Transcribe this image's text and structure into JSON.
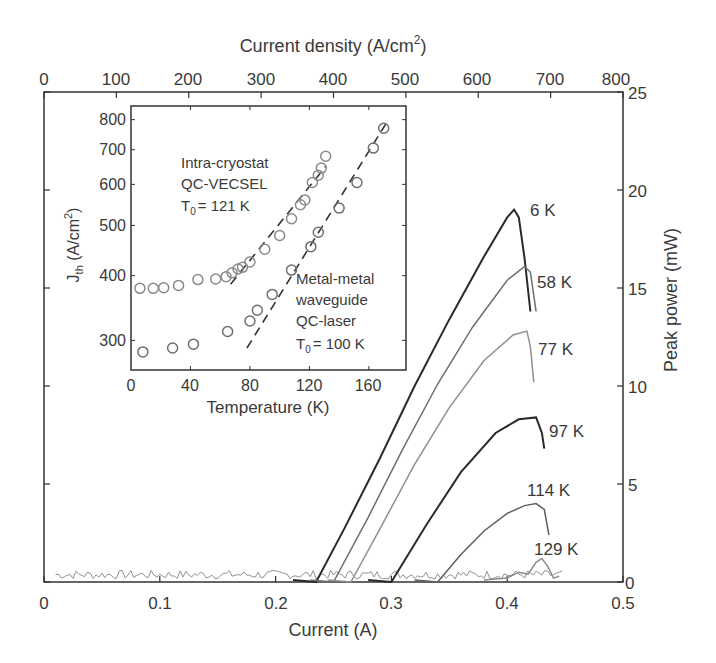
{
  "chart_data": [
    {
      "type": "line",
      "title": "",
      "xlabel": "Current (A)",
      "ylabel": "Peak power (mW)",
      "x2label": "Current density (A/cm²)",
      "xlim": [
        0,
        0.5
      ],
      "ylim": [
        0,
        25
      ],
      "x2lim": [
        0,
        800
      ],
      "xticks": [
        "0",
        "0.1",
        "0.2",
        "0.3",
        "0.4",
        "0.5"
      ],
      "yticks": [
        "0",
        "5",
        "10",
        "15",
        "20",
        "25"
      ],
      "x2ticks": [
        "0",
        "100",
        "200",
        "300",
        "400",
        "500",
        "600",
        "700",
        "800"
      ],
      "grid": false,
      "legend_position": "inline curve labels",
      "series": [
        {
          "name": "6 K",
          "color": "#2a2a2a",
          "x": [
            0.235,
            0.26,
            0.29,
            0.32,
            0.35,
            0.38,
            0.4,
            0.406,
            0.41,
            0.415,
            0.42
          ],
          "y": [
            0,
            2.8,
            6.3,
            10.0,
            13.4,
            16.6,
            18.6,
            19.0,
            18.6,
            16.5,
            13.8
          ]
        },
        {
          "name": "58 K",
          "color": "#6e6e6e",
          "x": [
            0.25,
            0.28,
            0.31,
            0.34,
            0.37,
            0.4,
            0.415,
            0.42,
            0.425
          ],
          "y": [
            0,
            3.3,
            6.8,
            10.1,
            13.0,
            15.4,
            16.1,
            15.8,
            13.8
          ]
        },
        {
          "name": "77 K",
          "color": "#8f8f8f",
          "x": [
            0.265,
            0.29,
            0.32,
            0.35,
            0.38,
            0.405,
            0.417,
            0.42,
            0.423
          ],
          "y": [
            0,
            2.7,
            6.0,
            8.9,
            11.3,
            12.6,
            12.8,
            12.0,
            10.2
          ]
        },
        {
          "name": "97 K",
          "color": "#2a2a2a",
          "x": [
            0.3,
            0.33,
            0.36,
            0.39,
            0.41,
            0.425,
            0.43,
            0.432
          ],
          "y": [
            0,
            2.9,
            5.6,
            7.6,
            8.3,
            8.4,
            7.6,
            6.8
          ]
        },
        {
          "name": "114 K",
          "color": "#5e5e5e",
          "x": [
            0.34,
            0.36,
            0.38,
            0.4,
            0.415,
            0.425,
            0.432,
            0.436
          ],
          "y": [
            0,
            1.4,
            2.6,
            3.5,
            3.9,
            4.0,
            3.7,
            2.4
          ]
        },
        {
          "name": "129 K",
          "color": "#8a8a8a",
          "x": [
            0.4,
            0.41,
            0.418,
            0.425,
            0.43,
            0.435,
            0.44,
            0.445
          ],
          "y": [
            0.2,
            0.5,
            0.4,
            1.0,
            1.2,
            0.8,
            0.2,
            0.3
          ]
        }
      ],
      "curve_labels": [
        "6 K",
        "58 K",
        "77 K",
        "97 K",
        "114 K",
        "129 K"
      ]
    },
    {
      "type": "scatter",
      "title": "Inset",
      "xlabel": "Temperature (K)",
      "ylabel": "J_th (A/cm²)",
      "xlim": [
        0,
        185
      ],
      "ylim": [
        263,
        850
      ],
      "yscale": "log",
      "xticks": [
        "0",
        "40",
        "80",
        "120",
        "160"
      ],
      "yticks": [
        "300",
        "400",
        "500",
        "600",
        "700",
        "800"
      ],
      "series": [
        {
          "name": "Intra-cryostat QC-VECSEL",
          "T0": "121 K",
          "color": "#8a8a8a",
          "x": [
            6,
            15,
            22,
            32,
            45,
            57,
            64,
            68,
            72,
            75,
            80,
            90,
            100,
            108,
            114,
            117,
            122,
            126,
            128,
            131
          ],
          "y": [
            378,
            378,
            379,
            383,
            393,
            394,
            398,
            405,
            412,
            415,
            425,
            450,
            478,
            515,
            548,
            560,
            605,
            625,
            645,
            680
          ]
        },
        {
          "name": "Metal-metal waveguide QC-laser",
          "T0": "100 K",
          "color": "#6e6e6e",
          "x": [
            8,
            28,
            42,
            65,
            80,
            85,
            95,
            108,
            121,
            126,
            140,
            152,
            163,
            170
          ],
          "y": [
            285,
            290,
            295,
            312,
            327,
            343,
            368,
            410,
            455,
            485,
            540,
            605,
            705,
            770
          ]
        }
      ],
      "fit_lines": [
        {
          "series": "Intra-cryostat QC-VECSEL",
          "style": "dashed",
          "x": [
            67,
            131
          ],
          "y": [
            385,
            650
          ]
        },
        {
          "series": "Metal-metal waveguide QC-laser",
          "style": "dashed",
          "x": [
            78,
            172
          ],
          "y": [
            290,
            790
          ]
        }
      ],
      "annotations": [
        "Intra-cryostat",
        "QC-VECSEL",
        "T0 = 121 K",
        "Metal-metal",
        "waveguide",
        "QC-laser",
        "T0 = 100 K"
      ]
    }
  ],
  "main": {
    "top_axis_label": "Current density (A/cm",
    "top_axis_sup": "2",
    "top_axis_close": ")",
    "bottom_axis_label": "Current (A)",
    "right_axis_label": "Peak power (mW)",
    "x_ticks": [
      "0",
      "0.1",
      "0.2",
      "0.3",
      "0.4",
      "0.5"
    ],
    "x2_ticks": [
      "0",
      "100",
      "200",
      "300",
      "400",
      "500",
      "600",
      "700",
      "800"
    ],
    "y_ticks": [
      "0",
      "5",
      "10",
      "15",
      "20",
      "25"
    ],
    "labels": {
      "k6": "6 K",
      "k58": "58 K",
      "k77": "77 K",
      "k97": "97 K",
      "k114": "114 K",
      "k129": "129 K"
    }
  },
  "inset": {
    "xlabel": "Temperature (K)",
    "ylabel_main": "J",
    "ylabel_sub": "th",
    "ylabel_rest": " (A/cm",
    "ylabel_sup": "2",
    "ylabel_close": ")",
    "x_ticks": [
      "0",
      "40",
      "80",
      "120",
      "160"
    ],
    "y_ticks": [
      "300",
      "400",
      "500",
      "600",
      "700",
      "800"
    ],
    "vecsel": {
      "line1": "Intra-cryostat",
      "line2": "QC-VECSEL",
      "t0_T": "T",
      "t0_sub": "0",
      "t0_val": "= 121 K"
    },
    "mm": {
      "line1": "Metal-metal",
      "line2": "waveguide",
      "line3": "QC-laser",
      "t0_T": "T",
      "t0_sub": "0",
      "t0_val": "= 100 K"
    }
  }
}
